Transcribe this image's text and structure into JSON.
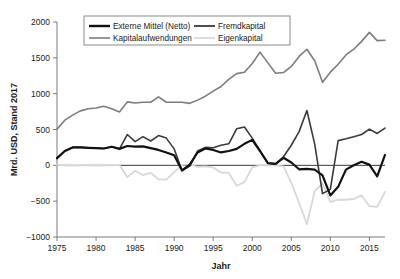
{
  "chart_data": {
    "type": "line",
    "title": "",
    "xlabel": "Jahr",
    "ylabel": "Mrd. USD, Stand 2017",
    "xlim": [
      1975,
      2017
    ],
    "ylim": [
      -1000,
      2000
    ],
    "xticks": [
      1975,
      1980,
      1985,
      1990,
      1995,
      2000,
      2005,
      2010,
      2015
    ],
    "yticks": [
      -1000,
      -500,
      0,
      500,
      1000,
      1500,
      2000
    ],
    "grid": false,
    "legend_position": "top-center",
    "zero_line": 0,
    "x": [
      1975,
      1976,
      1977,
      1978,
      1979,
      1980,
      1981,
      1982,
      1983,
      1984,
      1985,
      1986,
      1987,
      1988,
      1989,
      1990,
      1991,
      1992,
      1993,
      1994,
      1995,
      1996,
      1997,
      1998,
      1999,
      2000,
      2001,
      2002,
      2003,
      2004,
      2005,
      2006,
      2007,
      2008,
      2009,
      2010,
      2011,
      2012,
      2013,
      2014,
      2015,
      2016,
      2017
    ],
    "series": [
      {
        "name": "Externe Mittel (Netto)",
        "color": "#111111",
        "width": 2.2,
        "values": [
          100,
          200,
          250,
          250,
          245,
          240,
          235,
          260,
          230,
          270,
          260,
          265,
          240,
          215,
          180,
          140,
          -70,
          10,
          180,
          235,
          215,
          180,
          200,
          230,
          300,
          355,
          200,
          30,
          20,
          105,
          40,
          -55,
          -50,
          -60,
          -140,
          -420,
          -300,
          -60,
          0,
          50,
          10,
          -155,
          145
        ]
      },
      {
        "name": "Fremdkapital",
        "color": "#3a3a3a",
        "width": 1.6,
        "values": [
          95,
          200,
          250,
          250,
          245,
          240,
          235,
          260,
          230,
          430,
          330,
          400,
          340,
          415,
          380,
          230,
          -75,
          -10,
          200,
          250,
          245,
          280,
          300,
          510,
          535,
          380,
          200,
          30,
          20,
          120,
          280,
          470,
          765,
          295,
          -395,
          -335,
          345,
          370,
          400,
          430,
          505,
          445,
          520
        ]
      },
      {
        "name": "Kapitalaufwendungen",
        "color": "#7d7d7d",
        "width": 1.6,
        "values": [
          505,
          630,
          700,
          760,
          790,
          800,
          825,
          790,
          745,
          885,
          870,
          880,
          880,
          955,
          880,
          880,
          880,
          865,
          910,
          965,
          1035,
          1100,
          1200,
          1280,
          1300,
          1420,
          1580,
          1430,
          1285,
          1295,
          1380,
          1520,
          1620,
          1460,
          1160,
          1300,
          1410,
          1540,
          1620,
          1730,
          1855,
          1740,
          1745
        ]
      },
      {
        "name": "Eigenkapital",
        "color": "#d8d8d8",
        "width": 1.8,
        "values": [
          5,
          0,
          -5,
          0,
          0,
          -5,
          0,
          0,
          5,
          -165,
          -75,
          -135,
          -105,
          -195,
          -200,
          -95,
          5,
          15,
          -20,
          -15,
          -30,
          -100,
          -105,
          -285,
          -235,
          -30,
          0,
          0,
          0,
          -15,
          -240,
          -525,
          -820,
          -360,
          -250,
          -510,
          -480,
          -480,
          -470,
          -420,
          -570,
          -580,
          -370
        ]
      }
    ]
  },
  "axes": {
    "y_tick_labels": [
      "2000",
      "1500",
      "1000",
      "500",
      "0",
      "−500",
      "−1000"
    ],
    "x_tick_labels": [
      "1975",
      "1980",
      "1985",
      "1990",
      "1995",
      "2000",
      "2005",
      "2010",
      "2015"
    ],
    "y_axis_title": "Mrd. USD, Stand 2017",
    "x_axis_title": "Jahr"
  },
  "legend": {
    "entries": [
      {
        "label": "Externe Mittel (Netto)",
        "color": "#111111",
        "width": 2.4
      },
      {
        "label": "Fremdkapital",
        "color": "#3a3a3a",
        "width": 1.8
      },
      {
        "label": "Kapitalaufwendungen",
        "color": "#7d7d7d",
        "width": 1.6
      },
      {
        "label": "Eigenkapital",
        "color": "#d8d8d8",
        "width": 1.8
      }
    ]
  },
  "colors": {
    "axis": "#7a7a7a",
    "text": "#1a1a1a",
    "zero_line": "#3a3a3a",
    "background": "#ffffff",
    "legend_border": "#8c8c8c"
  }
}
